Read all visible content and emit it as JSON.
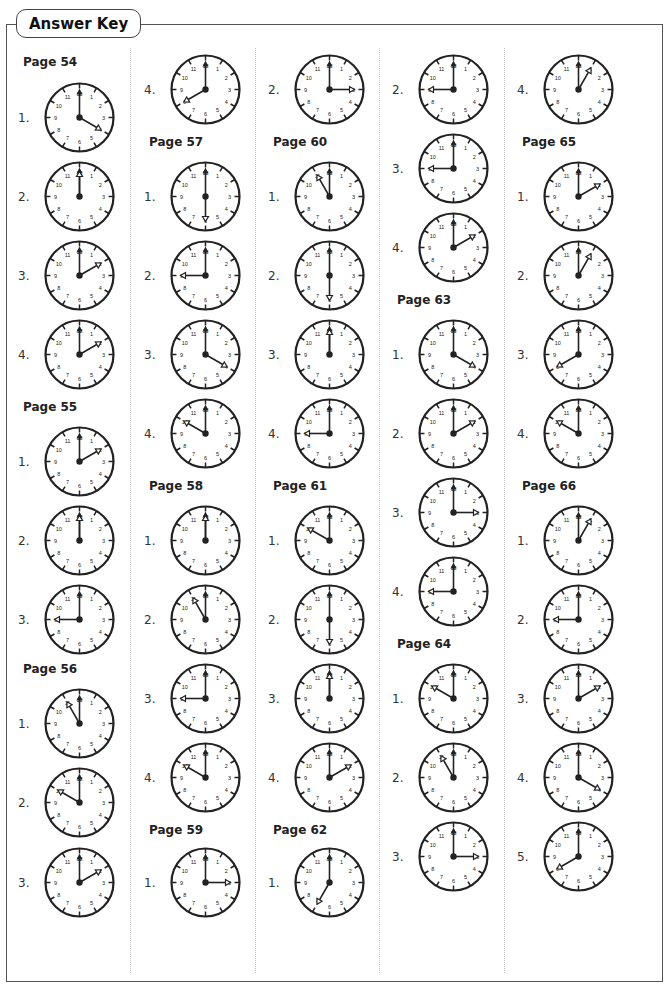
{
  "header": {
    "title": "Answer Key"
  },
  "columns": [
    {
      "x": 18,
      "entries": [
        {
          "type": "label",
          "text": "Page 54",
          "y": 55
        },
        {
          "type": "clock",
          "num": "1.",
          "hour": 4,
          "y": 80
        },
        {
          "type": "clock",
          "num": "2.",
          "hour": 12,
          "y": 159
        },
        {
          "type": "clock",
          "num": "3.",
          "hour": 2,
          "y": 238
        },
        {
          "type": "clock",
          "num": "4.",
          "hour": 2,
          "y": 317
        },
        {
          "type": "label",
          "text": "Page 55",
          "y": 400
        },
        {
          "type": "clock",
          "num": "1.",
          "hour": 2,
          "y": 424
        },
        {
          "type": "clock",
          "num": "2.",
          "hour": 12,
          "y": 503
        },
        {
          "type": "clock",
          "num": "3.",
          "hour": 9,
          "y": 582
        },
        {
          "type": "label",
          "text": "Page 56",
          "y": 662
        },
        {
          "type": "clock",
          "num": "1.",
          "hour": 11,
          "y": 686
        },
        {
          "type": "clock",
          "num": "2.",
          "hour": 10,
          "y": 765
        },
        {
          "type": "clock",
          "num": "3.",
          "hour": 2,
          "y": 845
        }
      ]
    },
    {
      "x": 144,
      "entries": [
        {
          "type": "clock",
          "num": "4.",
          "hour": 8,
          "y": 52
        },
        {
          "type": "label",
          "text": "Page 57",
          "y": 135
        },
        {
          "type": "clock",
          "num": "1.",
          "hour": 6,
          "y": 159
        },
        {
          "type": "clock",
          "num": "2.",
          "hour": 9,
          "y": 238
        },
        {
          "type": "clock",
          "num": "3.",
          "hour": 4,
          "y": 317
        },
        {
          "type": "clock",
          "num": "4.",
          "hour": 10,
          "y": 396
        },
        {
          "type": "label",
          "text": "Page 58",
          "y": 479
        },
        {
          "type": "clock",
          "num": "1.",
          "hour": 12,
          "y": 503
        },
        {
          "type": "clock",
          "num": "2.",
          "hour": 11,
          "y": 582
        },
        {
          "type": "clock",
          "num": "3.",
          "hour": 9,
          "y": 661
        },
        {
          "type": "clock",
          "num": "4.",
          "hour": 10,
          "y": 740
        },
        {
          "type": "label",
          "text": "Page 59",
          "y": 823
        },
        {
          "type": "clock",
          "num": "1.",
          "hour": 3,
          "y": 845
        }
      ]
    },
    {
      "x": 268,
      "entries": [
        {
          "type": "clock",
          "num": "2.",
          "hour": 3,
          "y": 52
        },
        {
          "type": "label",
          "text": "Page 60",
          "y": 135
        },
        {
          "type": "clock",
          "num": "1.",
          "hour": 11,
          "y": 159
        },
        {
          "type": "clock",
          "num": "2.",
          "hour": 6,
          "y": 238
        },
        {
          "type": "clock",
          "num": "3.",
          "hour": 12,
          "y": 317
        },
        {
          "type": "clock",
          "num": "4.",
          "hour": 9,
          "y": 396
        },
        {
          "type": "label",
          "text": "Page 61",
          "y": 479
        },
        {
          "type": "clock",
          "num": "1.",
          "hour": 10,
          "y": 503
        },
        {
          "type": "clock",
          "num": "2.",
          "hour": 6,
          "y": 582
        },
        {
          "type": "clock",
          "num": "3.",
          "hour": 12,
          "y": 661
        },
        {
          "type": "clock",
          "num": "4.",
          "hour": 2,
          "y": 740
        },
        {
          "type": "label",
          "text": "Page 62",
          "y": 823
        },
        {
          "type": "clock",
          "num": "1.",
          "hour": 7,
          "y": 845
        }
      ]
    },
    {
      "x": 392,
      "entries": [
        {
          "type": "clock",
          "num": "2.",
          "hour": 9,
          "y": 52
        },
        {
          "type": "clock",
          "num": "3.",
          "hour": 9,
          "y": 131
        },
        {
          "type": "clock",
          "num": "4.",
          "hour": 2,
          "y": 210
        },
        {
          "type": "label",
          "text": "Page 63",
          "y": 293
        },
        {
          "type": "clock",
          "num": "1.",
          "hour": 4,
          "y": 317
        },
        {
          "type": "clock",
          "num": "2.",
          "hour": 2,
          "y": 396
        },
        {
          "type": "clock",
          "num": "3.",
          "hour": 3,
          "y": 475
        },
        {
          "type": "clock",
          "num": "4.",
          "hour": 9,
          "y": 554
        },
        {
          "type": "label",
          "text": "Page 64",
          "y": 637
        },
        {
          "type": "clock",
          "num": "1.",
          "hour": 10,
          "y": 661
        },
        {
          "type": "clock",
          "num": "2.",
          "hour": 11,
          "y": 740
        },
        {
          "type": "clock",
          "num": "3.",
          "hour": 3,
          "y": 819
        }
      ]
    },
    {
      "x": 517,
      "entries": [
        {
          "type": "clock",
          "num": "4.",
          "hour": 1,
          "y": 52
        },
        {
          "type": "label",
          "text": "Page 65",
          "y": 135
        },
        {
          "type": "clock",
          "num": "1.",
          "hour": 2,
          "y": 159
        },
        {
          "type": "clock",
          "num": "2.",
          "hour": 1,
          "y": 238
        },
        {
          "type": "clock",
          "num": "3.",
          "hour": 8,
          "y": 317
        },
        {
          "type": "clock",
          "num": "4.",
          "hour": 10,
          "y": 396
        },
        {
          "type": "label",
          "text": "Page 66",
          "y": 479
        },
        {
          "type": "clock",
          "num": "1.",
          "hour": 1,
          "y": 503
        },
        {
          "type": "clock",
          "num": "2.",
          "hour": 9,
          "y": 582
        },
        {
          "type": "clock",
          "num": "3.",
          "hour": 2,
          "y": 661
        },
        {
          "type": "clock",
          "num": "4.",
          "hour": 4,
          "y": 740
        },
        {
          "type": "clock",
          "num": "5.",
          "hour": 8,
          "y": 819
        }
      ]
    }
  ],
  "separators_x": [
    130,
    255,
    379,
    504
  ],
  "colors": {
    "ink": "#222222",
    "frame": "#555555",
    "separator": "#c4c4c4"
  }
}
